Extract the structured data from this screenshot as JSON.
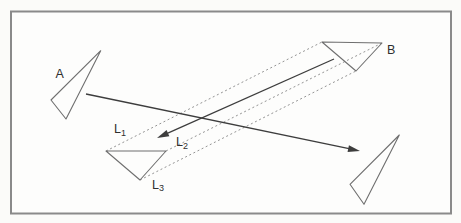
{
  "figure": {
    "canvas": {
      "width": 461,
      "height": 223,
      "background": "#fbfbf9"
    },
    "frame": {
      "x": 11,
      "y": 11.5,
      "width": 440,
      "height": 202,
      "stroke": "#8a8a8a",
      "fill": "#fdfdfc",
      "stroke_width": 2
    },
    "colors": {
      "triangle_stroke": "#6f6f6f",
      "dashed_stroke": "#949494",
      "arrow_stroke": "#3d3d3d",
      "label_color": "#2f2f2f"
    },
    "triangles": [
      {
        "name": "triangle-A",
        "points": [
          [
            100.7,
            50.7
          ],
          [
            51,
            100
          ],
          [
            66,
            119
          ]
        ]
      },
      {
        "name": "triangle-B",
        "points": [
          [
            322,
            42
          ],
          [
            382,
            43
          ],
          [
            356,
            71
          ]
        ]
      },
      {
        "name": "triangle-L",
        "points": [
          [
            106,
            151
          ],
          [
            166,
            151
          ],
          [
            140,
            180
          ]
        ]
      },
      {
        "name": "triangle-right",
        "points": [
          [
            399.3,
            135
          ],
          [
            350,
            184.3
          ],
          [
            364,
            204.3
          ]
        ]
      }
    ],
    "dashed_lines": [
      {
        "name": "correspondence-line-left",
        "from": [
          106,
          151
        ],
        "to": [
          322,
          42
        ]
      },
      {
        "name": "correspondence-line-right",
        "from": [
          166,
          151
        ],
        "to": [
          382,
          43
        ]
      },
      {
        "name": "correspondence-line-bottom",
        "from": [
          140,
          180
        ],
        "to": [
          356,
          71
        ]
      }
    ],
    "arrows": [
      {
        "name": "arrow-A-to-lower-right",
        "from": [
          86,
          94
        ],
        "to": [
          360,
          151
        ]
      },
      {
        "name": "arrow-B-to-L2",
        "from": [
          334,
          59
        ],
        "to": [
          157,
          138
        ]
      }
    ],
    "labels": [
      {
        "name": "label-A",
        "main": "A",
        "sub": "",
        "x": 55.5,
        "y": 78
      },
      {
        "name": "label-B",
        "main": "B",
        "sub": "",
        "x": 387,
        "y": 54
      },
      {
        "name": "label-L1",
        "main": "L",
        "sub": "1",
        "x": 114,
        "y": 133
      },
      {
        "name": "label-L2",
        "main": "L",
        "sub": "2",
        "x": 176,
        "y": 146
      },
      {
        "name": "label-L3",
        "main": "L",
        "sub": "3",
        "x": 152,
        "y": 188.5
      }
    ]
  }
}
